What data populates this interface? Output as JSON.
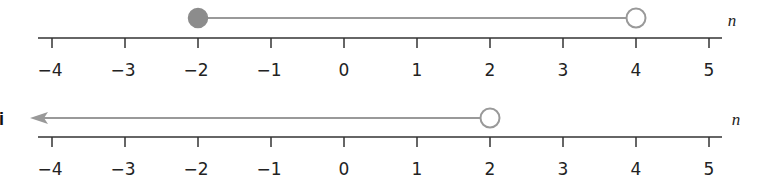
{
  "number_lines": [
    {
      "part_label": "",
      "variable": "n",
      "ticks": [
        "−4",
        "−3",
        "−2",
        "−1",
        "0",
        "1",
        "2",
        "3",
        "4",
        "5"
      ],
      "graph": {
        "type": "segment",
        "start": -2,
        "start_closed": true,
        "end": 4,
        "end_closed": false
      }
    },
    {
      "part_label": "i",
      "variable": "n",
      "ticks": [
        "−4",
        "−3",
        "−2",
        "−1",
        "0",
        "1",
        "2",
        "3",
        "4",
        "5"
      ],
      "graph": {
        "type": "ray-left",
        "end": 2,
        "end_closed": false
      }
    }
  ],
  "colors": {
    "axis": "#333333",
    "graph": "#999999",
    "point_fill": "#8c8c8c"
  }
}
